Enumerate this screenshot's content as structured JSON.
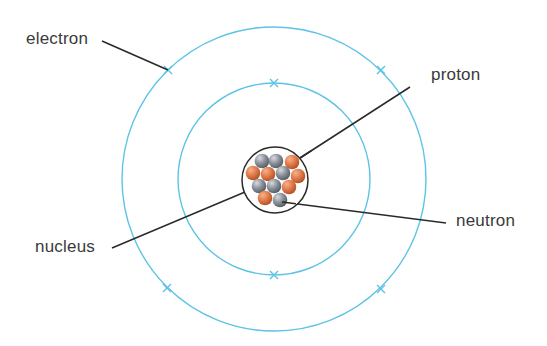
{
  "labels": {
    "electron": "electron",
    "proton": "proton",
    "neutron": "neutron",
    "nucleus": "nucleus"
  },
  "colors": {
    "orbit": "#5ec3e6",
    "leader_line": "#2a2a2a",
    "nucleus_outline": "#2a2a2a",
    "proton": "#e07a4a",
    "neutron": "#8a9098",
    "text": "#3a3a3a",
    "background": "#ffffff"
  },
  "orbits": [
    {
      "name": "inner-orbit",
      "cx": 274,
      "cy": 179,
      "r": 96
    },
    {
      "name": "outer-orbit",
      "cx": 274,
      "cy": 179,
      "r": 152
    }
  ],
  "electrons": [
    {
      "orbit": "inner",
      "x": 274,
      "y": 83
    },
    {
      "orbit": "inner",
      "x": 274,
      "y": 275
    },
    {
      "orbit": "outer",
      "x": 168,
      "y": 70
    },
    {
      "orbit": "outer",
      "x": 381,
      "y": 70
    },
    {
      "orbit": "outer",
      "x": 167,
      "y": 288
    },
    {
      "orbit": "outer",
      "x": 381,
      "y": 289
    }
  ],
  "nucleus": {
    "cx": 275,
    "cy": 180,
    "r": 33,
    "particles": [
      {
        "type": "neutron",
        "x": 262,
        "y": 161
      },
      {
        "type": "neutron",
        "x": 276,
        "y": 161
      },
      {
        "type": "proton",
        "x": 292,
        "y": 162
      },
      {
        "type": "proton",
        "x": 253,
        "y": 173
      },
      {
        "type": "proton",
        "x": 268,
        "y": 174
      },
      {
        "type": "neutron",
        "x": 283,
        "y": 173
      },
      {
        "type": "proton",
        "x": 298,
        "y": 176
      },
      {
        "type": "neutron",
        "x": 259,
        "y": 186
      },
      {
        "type": "neutron",
        "x": 274,
        "y": 186
      },
      {
        "type": "proton",
        "x": 289,
        "y": 187
      },
      {
        "type": "proton",
        "x": 265,
        "y": 198
      },
      {
        "type": "neutron",
        "x": 280,
        "y": 200
      }
    ]
  },
  "leaders": [
    {
      "name": "electron-leader",
      "x1": 102,
      "y1": 41,
      "x2": 168,
      "y2": 70
    },
    {
      "name": "proton-leader",
      "x1": 300,
      "y1": 158,
      "x2": 410,
      "y2": 87
    },
    {
      "name": "nucleus-leader",
      "x1": 112,
      "y1": 248,
      "x2": 245,
      "y2": 192
    },
    {
      "name": "neutron-leader",
      "x1": 282,
      "y1": 202,
      "x2": 446,
      "y2": 223
    }
  ],
  "label_positions": {
    "electron": {
      "left": 26,
      "top": 30
    },
    "proton": {
      "left": 431,
      "top": 66
    },
    "neutron": {
      "left": 456,
      "top": 212
    },
    "nucleus": {
      "left": 35,
      "top": 238
    }
  }
}
